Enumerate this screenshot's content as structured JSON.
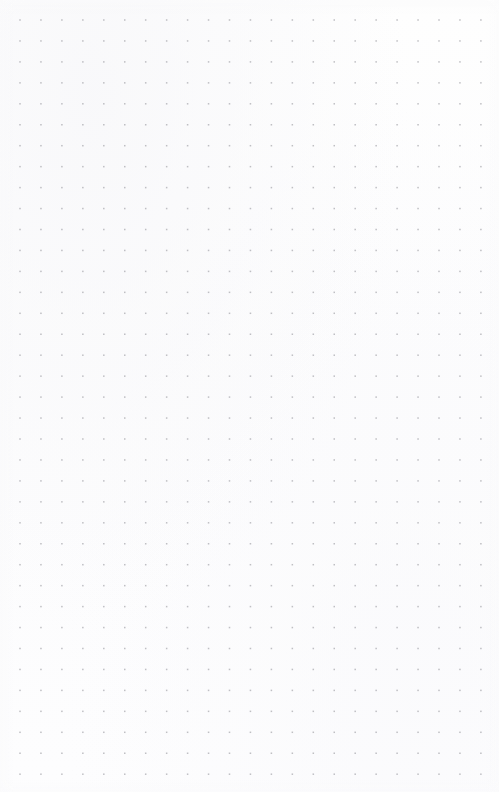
{
  "page": {
    "kind": "dot-grid-paper",
    "width": 499,
    "height": 792,
    "background_color": "#fdfdfd",
    "content_text": ""
  },
  "grid": {
    "dot_color": "#9a9aa0",
    "dot_size_px": 1.5,
    "spacing_x_px": 20.95,
    "spacing_y_px": 20.95,
    "origin_x_px": 20,
    "origin_y_px": 20,
    "columns": 23,
    "rows": 37,
    "margin_left_px": 20,
    "margin_top_px": 20,
    "margin_right_px": 18,
    "margin_bottom_px": 17,
    "opacity": 0.62
  }
}
